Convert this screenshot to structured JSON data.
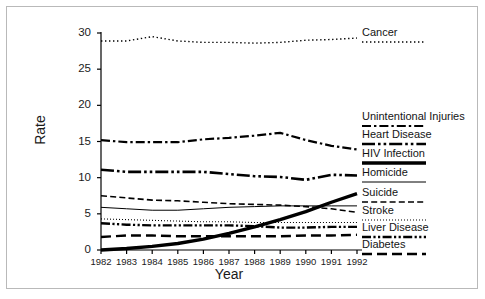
{
  "chart_data": {
    "type": "line",
    "title": "",
    "xlabel": "Year",
    "ylabel": "Rate",
    "xlim": [
      1982,
      1992
    ],
    "ylim": [
      0,
      30
    ],
    "yticks": [
      0,
      5,
      10,
      15,
      20,
      25,
      30
    ],
    "grid": false,
    "legend_position": "right",
    "x": [
      1982,
      1983,
      1984,
      1985,
      1986,
      1987,
      1988,
      1989,
      1990,
      1991,
      1992
    ],
    "series": [
      {
        "name": "Cancer",
        "style": "dotted",
        "values": [
          28.9,
          28.9,
          29.5,
          28.9,
          28.7,
          28.7,
          28.6,
          28.7,
          29.0,
          29.1,
          29.3
        ]
      },
      {
        "name": "Unintentional Injuries",
        "style": "dash-dot",
        "values": [
          15.2,
          14.9,
          14.9,
          14.9,
          15.3,
          15.5,
          15.8,
          16.2,
          15.2,
          14.4,
          13.9
        ]
      },
      {
        "name": "Heart Disease",
        "style": "dash-dot-dot",
        "values": [
          11.1,
          10.8,
          10.8,
          10.8,
          10.8,
          10.5,
          10.2,
          10.1,
          9.7,
          10.4,
          10.3
        ]
      },
      {
        "name": "HIV Infection",
        "style": "thick-solid",
        "values": [
          0.0,
          0.2,
          0.5,
          0.9,
          1.5,
          2.3,
          3.2,
          4.2,
          5.3,
          6.6,
          7.8
        ]
      },
      {
        "name": "Homicide",
        "style": "thin-solid",
        "values": [
          5.9,
          5.7,
          5.5,
          5.5,
          5.7,
          5.9,
          6.0,
          6.1,
          6.1,
          6.1,
          6.1
        ]
      },
      {
        "name": "Suicide",
        "style": "dashed",
        "values": [
          7.5,
          7.2,
          6.9,
          6.8,
          6.6,
          6.4,
          6.3,
          6.2,
          6.0,
          5.7,
          5.2
        ]
      },
      {
        "name": "Stroke",
        "style": "fine-dotted",
        "values": [
          4.3,
          4.2,
          4.1,
          4.0,
          3.9,
          3.9,
          3.8,
          3.8,
          3.8,
          3.8,
          3.8
        ]
      },
      {
        "name": "Liver Disease",
        "style": "dash-dot-dot-thick",
        "values": [
          3.7,
          3.5,
          3.4,
          3.4,
          3.4,
          3.4,
          3.3,
          3.1,
          3.1,
          3.2,
          3.2
        ]
      },
      {
        "name": "Diabetes",
        "style": "long-dash",
        "values": [
          1.8,
          2.0,
          2.0,
          1.9,
          1.9,
          1.9,
          1.9,
          1.9,
          2.0,
          2.0,
          2.1
        ]
      }
    ]
  },
  "axis": {
    "ylabel": "Rate",
    "xlabel": "Year",
    "yticks": [
      "0",
      "5",
      "10",
      "15",
      "20",
      "25",
      "30"
    ],
    "xticks": [
      "1982",
      "1983",
      "1984",
      "1985",
      "1986",
      "1987",
      "1988",
      "1989",
      "1990",
      "1991",
      "1992"
    ]
  },
  "legend": {
    "items": [
      {
        "label": "Cancer",
        "style": "dotted"
      },
      {
        "label": "Unintentional Injuries",
        "style": "dash-dot"
      },
      {
        "label": "Heart Disease",
        "style": "dash-dot-dot"
      },
      {
        "label": "HIV Infection",
        "style": "thick-solid"
      },
      {
        "label": "Homicide",
        "style": "thin-solid"
      },
      {
        "label": "Suicide",
        "style": "dashed"
      },
      {
        "label": "Stroke",
        "style": "fine-dotted"
      },
      {
        "label": "Liver Disease",
        "style": "dash-dot-dot-thick"
      },
      {
        "label": "Diabetes",
        "style": "long-dash"
      }
    ]
  },
  "colors": {
    "ink": "#000000",
    "frame": "#b9b9b9",
    "background": "#ffffff"
  }
}
